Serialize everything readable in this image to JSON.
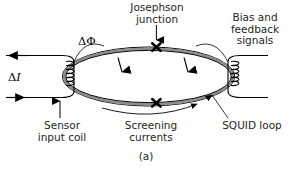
{
  "figure": {
    "caption": "(a)",
    "colors": {
      "line": "#000000",
      "ring_fill": "#8d8d8d",
      "text": "#231f20",
      "background": "#ffffff"
    }
  },
  "labels": {
    "josephson_junction": "Josephson\njunction",
    "bias_feedback": "Bias and\nfeedback\nsignals",
    "sensor_input_coil": "Sensor\ninput coil",
    "screening_currents": "Screening\ncurrents",
    "squid_loop": "SQUID loop"
  },
  "symbols": {
    "delta_phi": "ΔΦ",
    "delta_i_prefix": "Δ",
    "delta_i_var": "I"
  },
  "components": {
    "squid_loop": {
      "name": "SQUID loop",
      "shape": "ellipse",
      "junction_count": 2,
      "junction_marker": "x-cross"
    },
    "input_coil": {
      "name": "Sensor input coil",
      "turns": 4,
      "side": "left"
    },
    "bias_coil": {
      "name": "Bias and feedback coil",
      "turns": 4,
      "side": "right"
    },
    "screening_current_arrows": 2,
    "input_current_arrows": {
      "top": "left",
      "bottom": "right"
    }
  }
}
